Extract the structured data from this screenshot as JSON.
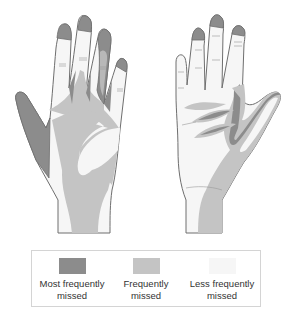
{
  "diagram": {
    "views": [
      {
        "name": "back of hand",
        "label": "dorsal"
      },
      {
        "name": "palm of hand",
        "label": "palmar"
      }
    ]
  },
  "legend": {
    "items": [
      {
        "label_line1": "Most frequently",
        "label_line2": "missed",
        "color": "#8c8c8c"
      },
      {
        "label_line1": "Frequently",
        "label_line2": "missed",
        "color": "#c4c4c4"
      },
      {
        "label_line1": "Less frequently",
        "label_line2": "missed",
        "color": "#f6f6f6"
      }
    ]
  },
  "colors": {
    "outline": "#6e6e6e",
    "most": "#8c8c8c",
    "frequent": "#c4c4c4",
    "less": "#f6f6f6"
  }
}
